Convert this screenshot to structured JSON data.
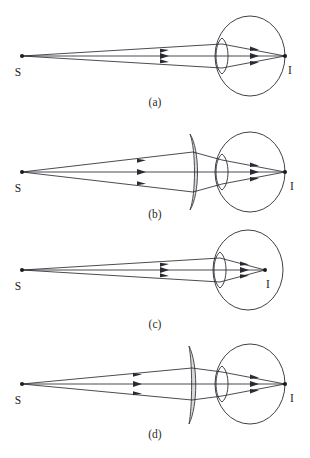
{
  "figure": {
    "background_color": "#ffffff",
    "ink_color": "#2a2a33",
    "lens_fill_color": "#d9d9d9",
    "source_label": "S",
    "image_label": "I",
    "ray_count": 3,
    "panels": [
      {
        "id": "a",
        "caption": "(a)",
        "source_label": "S",
        "image_label": "I",
        "corrective_lens": "none",
        "image_position": "at back of eye (retina)",
        "description": "Rays from point source S pass through the eye lens and converge at image point I located at the far right of the eyeball."
      },
      {
        "id": "b",
        "caption": "(b)",
        "source_label": "S",
        "image_label": "I",
        "corrective_lens": "converging meniscus",
        "image_position": "at back of eye (retina)",
        "description": "A thick-centered meniscus corrective lens is placed in front of the eye; rays converge at image point I at the back of the eyeball."
      },
      {
        "id": "c",
        "caption": "(c)",
        "source_label": "S",
        "image_label": "I",
        "corrective_lens": "none",
        "image_position": "inside the eyeball, in front of the retina",
        "description": "Rays from S converge to image point I inside the eyeball before reaching the back surface."
      },
      {
        "id": "d",
        "caption": "(d)",
        "source_label": "S",
        "image_label": "I",
        "corrective_lens": "diverging meniscus",
        "image_position": "at back of eye (retina)",
        "description": "A thin-centered diverging meniscus corrective lens is placed in front of the eye; rays converge at image point I at the back of the eyeball."
      }
    ]
  }
}
